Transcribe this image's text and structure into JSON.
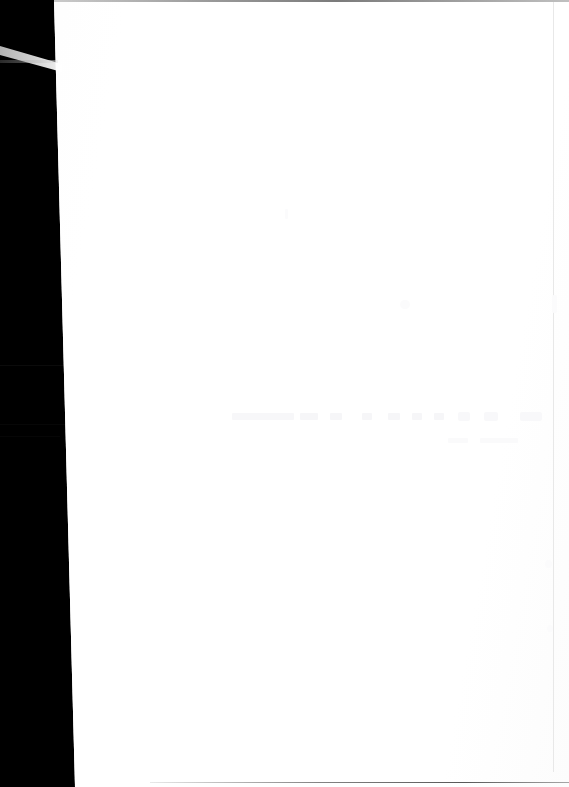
{
  "capture": {
    "title": "Blank document capture",
    "description": "Overexposed screenshot: blank white page surface with dark left letterbox band",
    "width_px": "569",
    "height_px": "787"
  },
  "colors": {
    "page_background": "#ffffff",
    "letterbox": "#000000",
    "hairline": "#787878",
    "ghost": "#f7f7f9",
    "streak_highlight": "#ffffff"
  },
  "regions": {
    "letterbox": {
      "name": "left-letterbox-band",
      "label": "",
      "edge_top_x": "54",
      "edge_bottom_x": "75"
    },
    "page": {
      "name": "document-surface",
      "label": "",
      "content": ""
    },
    "streak": {
      "name": "light-streak",
      "label": ""
    }
  },
  "ghost_toolbar": {
    "label": "",
    "items": [
      {
        "label": "",
        "left": "232",
        "width": "62"
      },
      {
        "label": "",
        "left": "300",
        "width": "18"
      },
      {
        "label": "",
        "left": "330",
        "width": "12"
      },
      {
        "label": "",
        "left": "362",
        "width": "10"
      },
      {
        "label": "",
        "left": "388",
        "width": "12"
      },
      {
        "label": "",
        "left": "412",
        "width": "10"
      },
      {
        "label": "",
        "left": "434",
        "width": "10"
      },
      {
        "label": "",
        "left": "458",
        "width": "12"
      },
      {
        "label": "",
        "left": "484",
        "width": "14"
      },
      {
        "label": "",
        "left": "520",
        "width": "22"
      }
    ],
    "subitems": [
      {
        "label": "",
        "left": "448",
        "width": "20"
      },
      {
        "label": "",
        "left": "480",
        "width": "38"
      }
    ]
  },
  "band_seams": [
    {
      "label": "",
      "top": "365"
    },
    {
      "label": "",
      "top": "424"
    },
    {
      "label": "",
      "top": "436"
    }
  ]
}
